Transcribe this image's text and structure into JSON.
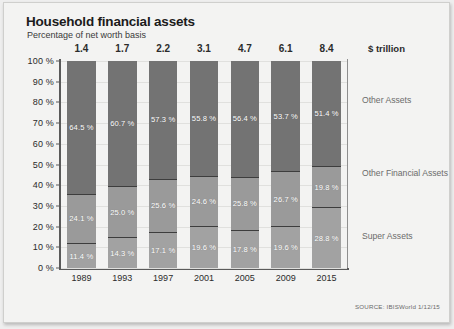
{
  "chart_data": {
    "type": "bar",
    "title": "Household financial assets",
    "subtitle": "Percentage of net worth basis",
    "xlabel": "",
    "ylabel": "",
    "ylim": [
      0,
      100
    ],
    "grid": true,
    "stacked": true,
    "legend_position": "right",
    "categories": [
      "1989",
      "1993",
      "1997",
      "2001",
      "2005",
      "2009",
      "2015"
    ],
    "ytick_labels": [
      "100 %",
      "90 %",
      "80 %",
      "70 %",
      "60 %",
      "50 %",
      "40 %",
      "30 %",
      "20 %",
      "10 %",
      "0 %"
    ],
    "ytick_values": [
      100,
      90,
      80,
      70,
      60,
      50,
      40,
      30,
      20,
      10,
      0
    ],
    "series": [
      {
        "name": "Other Assets",
        "color": "#737373",
        "values": [
          64.5,
          60.7,
          57.3,
          55.8,
          56.4,
          53.7,
          51.4
        ],
        "labels": [
          "64.5 %",
          "60.7 %",
          "57.3 %",
          "55.8 %",
          "56.4 %",
          "53.7 %",
          "51.4 %"
        ]
      },
      {
        "name": "Other Financial Assets",
        "color": "#9a9a9a",
        "values": [
          24.1,
          25.0,
          25.6,
          24.6,
          25.8,
          26.7,
          19.8
        ],
        "labels": [
          "24.1 %",
          "25.0 %",
          "25.6 %",
          "24.6 %",
          "25.8 %",
          "26.7 %",
          "19.8 %"
        ]
      },
      {
        "name": "Super Assets",
        "color": "#a2a2a2",
        "values": [
          11.4,
          14.3,
          17.1,
          19.6,
          17.8,
          19.6,
          28.8
        ],
        "labels": [
          "11.4 %",
          "14.3 %",
          "17.1 %",
          "19.6 %",
          "17.8 %",
          "19.6 %",
          "28.8 %"
        ]
      }
    ],
    "top_annotations": {
      "unit": "$ trillion",
      "values": [
        "1.4",
        "1.7",
        "2.2",
        "3.1",
        "4.7",
        "6.1",
        "8.4"
      ]
    },
    "side_labels": {
      "other_assets": "Other Assets",
      "other_financial_assets": "Other Financial Assets",
      "super_assets": "Super Assets"
    },
    "source": "SOURCE: IBISWorld 1/12/15"
  }
}
